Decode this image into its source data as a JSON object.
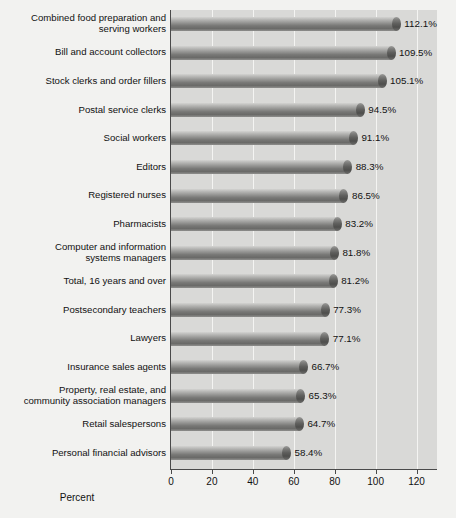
{
  "chart_data": {
    "type": "bar",
    "orientation": "horizontal",
    "title": "",
    "subtitle": "",
    "xlabel": "Percent",
    "ylabel": "",
    "xlim": [
      0,
      130
    ],
    "xticks": [
      0,
      20,
      40,
      60,
      80,
      100,
      120
    ],
    "xtick_labels": [
      "0",
      "20",
      "40",
      "60",
      "80",
      "100",
      "120"
    ],
    "grid": true,
    "grid_axis": "x",
    "legend": false,
    "value_label_suffix": "%",
    "categories": [
      "Combined food preparation and\nserving workers",
      "Bill and account collectors",
      "Stock clerks and order fillers",
      "Postal service clerks",
      "Social workers",
      "Editors",
      "Registered nurses",
      "Pharmacists",
      "Computer and information\nsystems managers",
      "Total, 16 years and over",
      "Postsecondary teachers",
      "Lawyers",
      "Insurance sales agents",
      "Property, real estate, and\ncommunity association managers",
      "Retail salespersons",
      "Personal financial advisors"
    ],
    "values": [
      112.1,
      109.5,
      105.1,
      94.5,
      91.1,
      88.3,
      86.5,
      83.2,
      81.8,
      81.2,
      77.3,
      77.1,
      66.7,
      65.3,
      64.7,
      58.4
    ],
    "value_labels": [
      "112.1%",
      "109.5%",
      "105.1%",
      "94.5%",
      "91.1%",
      "88.3%",
      "86.5%",
      "83.2%",
      "81.8%",
      "81.2%",
      "77.3%",
      "77.1%",
      "66.7%",
      "65.3%",
      "64.7%",
      "58.4%"
    ]
  },
  "colors": {
    "plot_background": "#d9d9d7",
    "page_background": "#f2f2f0",
    "gridline": "#f4f4f2",
    "axis": "#4a4a4a",
    "bar_light": "#d3d3d1",
    "bar_dark": "#6a6a68",
    "bar_cap": "#5e5e5c",
    "text": "#111111"
  }
}
